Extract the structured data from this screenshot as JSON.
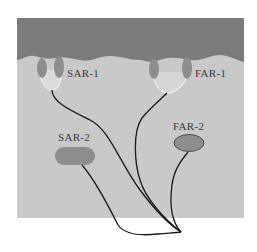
{
  "diagram": {
    "colors": {
      "background": "#ffffff",
      "upper_layer": "#7b7b7b",
      "lower_region": "#c9c9c9",
      "receptor_fill": "#8d8d8d",
      "receptor_outline": "#e8e8e8",
      "fiber": "#1a1a1a"
    },
    "labels": {
      "sar1": "SAR-1",
      "far1": "FAR-1",
      "sar2": "SAR-2",
      "far2": "FAR-2"
    },
    "caption": ""
  }
}
